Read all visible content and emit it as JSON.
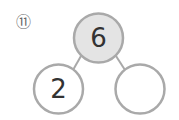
{
  "problem": {
    "number_label": "⑪",
    "top": {
      "value": "6"
    },
    "left": {
      "value": "2"
    },
    "right": {
      "value": ""
    }
  },
  "colors": {
    "stroke": "#a9a9a9",
    "top_fill": "#e4e4e4",
    "child_fill": "#ffffff",
    "text": "#333333"
  }
}
